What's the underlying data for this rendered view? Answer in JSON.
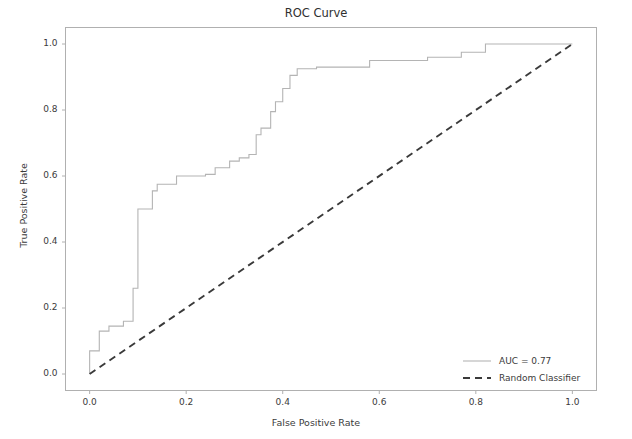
{
  "figure": {
    "title": "ROC Curve",
    "background": "#ffffff",
    "frame_color": "#b0b0b0"
  },
  "axes": {
    "xlabel": "False Positive Rate",
    "ylabel": "True Positive Rate",
    "xticks": [
      "0.0",
      "0.2",
      "0.4",
      "0.6",
      "0.8",
      "1.0"
    ],
    "yticks": [
      "0.0",
      "0.2",
      "0.4",
      "0.6",
      "0.8",
      "1.0"
    ],
    "xlim": [
      -0.05,
      1.05
    ],
    "ylim": [
      -0.05,
      1.05
    ],
    "grid": false
  },
  "legend": {
    "position": "lower right",
    "frame": false,
    "entries": [
      {
        "label": "AUC = 0.77",
        "style": "solid",
        "color": "#b4b4b4"
      },
      {
        "label": "Random Classifier",
        "style": "dashed",
        "color": "#3a3a3a"
      }
    ]
  },
  "chart_data": {
    "type": "line",
    "title": "ROC Curve",
    "xlabel": "False Positive Rate",
    "ylabel": "True Positive Rate",
    "xlim": [
      -0.05,
      1.05
    ],
    "ylim": [
      -0.05,
      1.05
    ],
    "grid": false,
    "legend_position": "lower right",
    "auc": 0.77,
    "series": [
      {
        "name": "AUC = 0.77",
        "type": "step",
        "drawstyle": "steps-post",
        "color": "#b4b4b4",
        "linestyle": "solid",
        "x": [
          0.0,
          0.0,
          0.02,
          0.02,
          0.04,
          0.04,
          0.07,
          0.07,
          0.09,
          0.09,
          0.1,
          0.1,
          0.13,
          0.13,
          0.14,
          0.14,
          0.18,
          0.18,
          0.24,
          0.24,
          0.26,
          0.26,
          0.29,
          0.29,
          0.31,
          0.31,
          0.33,
          0.33,
          0.345,
          0.345,
          0.355,
          0.355,
          0.375,
          0.375,
          0.385,
          0.385,
          0.4,
          0.4,
          0.415,
          0.415,
          0.43,
          0.43,
          0.47,
          0.47,
          0.58,
          0.58,
          0.7,
          0.7,
          0.77,
          0.77,
          0.82,
          0.82,
          1.0
        ],
        "y": [
          0.0,
          0.07,
          0.07,
          0.13,
          0.13,
          0.145,
          0.145,
          0.16,
          0.16,
          0.26,
          0.26,
          0.5,
          0.5,
          0.555,
          0.555,
          0.575,
          0.575,
          0.6,
          0.6,
          0.605,
          0.605,
          0.625,
          0.625,
          0.645,
          0.645,
          0.655,
          0.655,
          0.665,
          0.665,
          0.725,
          0.725,
          0.745,
          0.745,
          0.795,
          0.795,
          0.825,
          0.825,
          0.865,
          0.865,
          0.905,
          0.905,
          0.925,
          0.925,
          0.93,
          0.93,
          0.95,
          0.95,
          0.96,
          0.96,
          0.975,
          0.975,
          1.0,
          1.0
        ]
      },
      {
        "name": "Random Classifier",
        "type": "line",
        "color": "#3a3a3a",
        "linestyle": "dashed",
        "x": [
          0.0,
          1.0
        ],
        "y": [
          0.0,
          1.0
        ]
      }
    ]
  }
}
